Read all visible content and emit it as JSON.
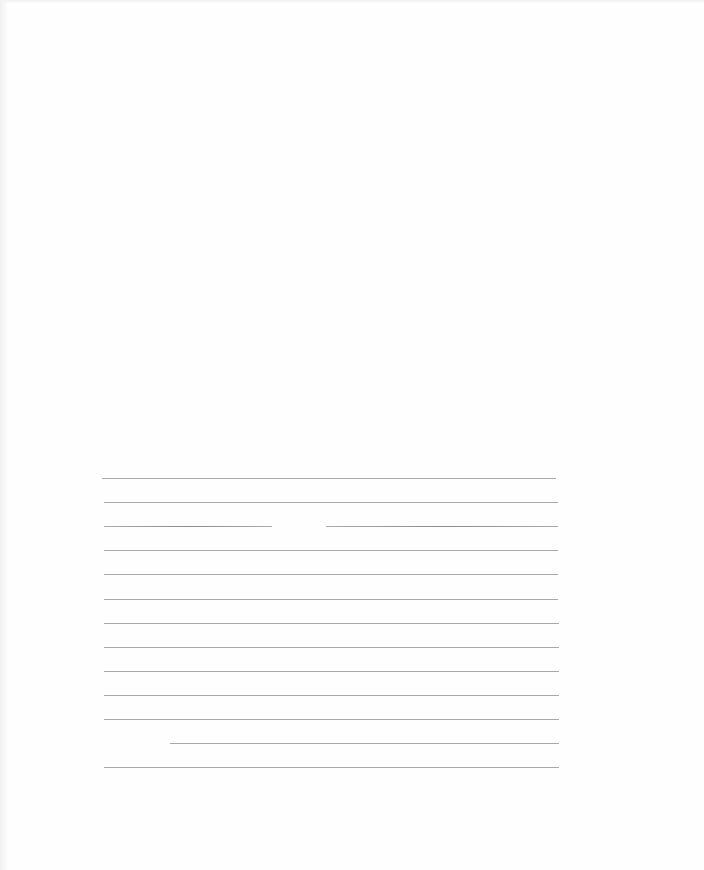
{
  "page": {
    "type": "blank ruled sheet",
    "background_color": "#ffffff",
    "rule_color": "#a9a9a9",
    "rule_count": 13,
    "rules": [
      {
        "y": 478,
        "x1": 102,
        "x2": 556
      },
      {
        "y": 502,
        "x1": 104,
        "x2": 558
      },
      {
        "y": 526,
        "segments": [
          [
            104,
            272
          ],
          [
            326,
            558
          ]
        ]
      },
      {
        "y": 550,
        "x1": 104,
        "x2": 558
      },
      {
        "y": 574,
        "x1": 104,
        "x2": 558
      },
      {
        "y": 599,
        "x1": 104,
        "x2": 558
      },
      {
        "y": 623,
        "x1": 104,
        "x2": 559
      },
      {
        "y": 647,
        "x1": 104,
        "x2": 559
      },
      {
        "y": 671,
        "x1": 104,
        "x2": 559
      },
      {
        "y": 695,
        "x1": 104,
        "x2": 559
      },
      {
        "y": 719,
        "x1": 104,
        "x2": 559
      },
      {
        "y": 743,
        "x1": 170,
        "x2": 559
      },
      {
        "y": 767,
        "x1": 104,
        "x2": 559
      }
    ]
  }
}
